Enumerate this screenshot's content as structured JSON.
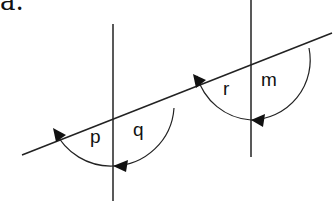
{
  "heading": "a.",
  "diagram": {
    "stroke_color": "#222222",
    "transversal": {
      "x1": 22,
      "y1": 155,
      "x2": 332,
      "y2": 33
    },
    "lines": [
      {
        "name": "left-vertical",
        "x1": 113,
        "y1": 24,
        "x2": 113,
        "y2": 201
      },
      {
        "name": "right-vertical",
        "x1": 251,
        "y1": 0,
        "x2": 251,
        "y2": 157
      }
    ],
    "angles": [
      {
        "label": "p",
        "x": 96,
        "y": 136
      },
      {
        "label": "q",
        "x": 138,
        "y": 129
      },
      {
        "label": "r",
        "x": 228,
        "y": 93
      },
      {
        "label": "m",
        "x": 266,
        "y": 82
      }
    ]
  }
}
